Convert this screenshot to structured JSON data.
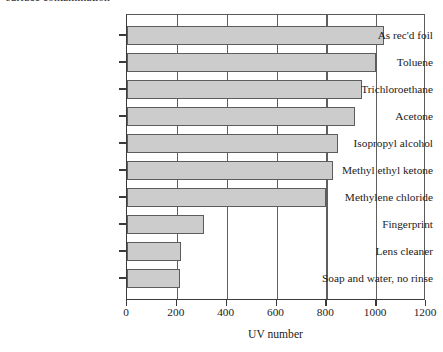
{
  "caption": {
    "text": "surface contamination"
  },
  "chart_data": {
    "type": "bar",
    "orientation": "horizontal",
    "title": "",
    "xlabel": "UV number",
    "ylabel": "",
    "xlim": [
      0,
      1200
    ],
    "xticks": [
      0,
      200,
      400,
      600,
      800,
      1000,
      1200
    ],
    "xtick_labels": [
      "0",
      "200",
      "400",
      "600",
      "800",
      "1000",
      "1200"
    ],
    "grid": "vertical",
    "legend": "none",
    "bar_fill_color": "#cccccc",
    "bar_edge_color": "#5c5c5c",
    "axis_color": "#3a3a3a",
    "categories": [
      "As rec'd foil",
      "Toluene",
      "Trichloroethane",
      "Acetone",
      "Isopropyl alcohol",
      "Methyl ethyl ketone",
      "Methylene chloride",
      "Fingerprint",
      "Lens cleaner",
      "Soap and water, no rinse"
    ],
    "values": [
      1030,
      1000,
      945,
      915,
      845,
      825,
      800,
      310,
      218,
      212
    ]
  }
}
